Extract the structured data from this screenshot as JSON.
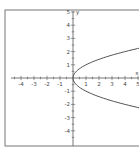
{
  "chart_data": {
    "type": "line",
    "title": "",
    "xlabel": "x",
    "ylabel": "y",
    "xlim": [
      -5,
      5
    ],
    "ylim": [
      -5,
      5
    ],
    "x_ticks": [
      -4,
      -3,
      -2,
      -1,
      1,
      2,
      3,
      4,
      5
    ],
    "y_ticks": [
      5,
      4,
      3,
      2,
      1,
      -1,
      -2,
      -3,
      -4
    ],
    "x_tick_labels": [
      "-4",
      "-3",
      "-2",
      "-1",
      "1",
      "2",
      "3",
      "4",
      "5"
    ],
    "y_tick_labels": [
      "5",
      "4",
      "3",
      "2",
      "1",
      "-1",
      "-2",
      "-3",
      "-4"
    ],
    "minor_tick_step": 0.5,
    "grid": false,
    "series": [
      {
        "name": "x = y^2",
        "equation": "x = y^2",
        "points": [
          [
            5,
            -2.236
          ],
          [
            4,
            -2
          ],
          [
            2.25,
            -1.5
          ],
          [
            1,
            -1
          ],
          [
            0.25,
            -0.5
          ],
          [
            0,
            0
          ],
          [
            0.25,
            0.5
          ],
          [
            1,
            1
          ],
          [
            2.25,
            1.5
          ],
          [
            4,
            2
          ],
          [
            5,
            2.236
          ]
        ]
      }
    ],
    "colors": {
      "curve": "#555555",
      "axes": "#555555",
      "frame": "#666666"
    }
  }
}
